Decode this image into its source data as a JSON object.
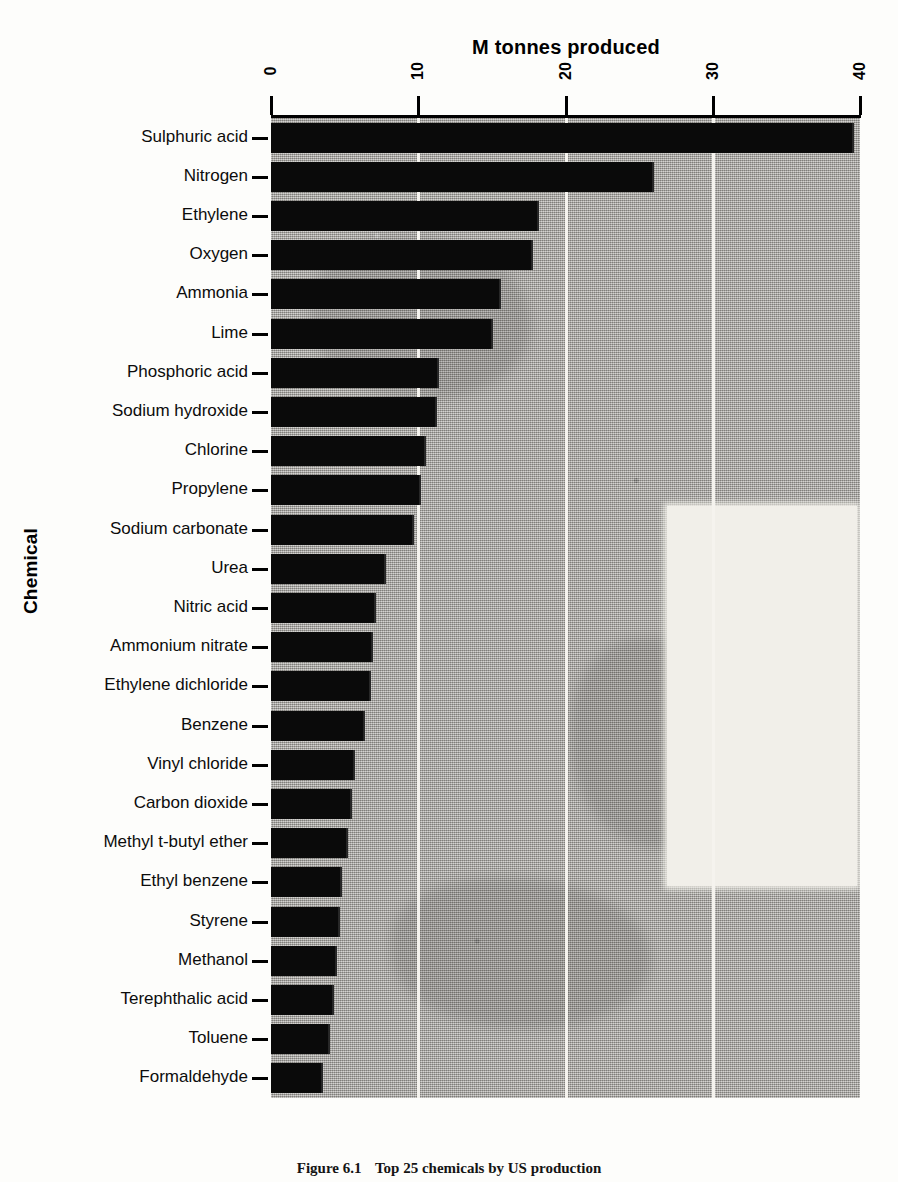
{
  "figure": {
    "caption_number": "Figure 6.1",
    "caption_text": "Top 25 chemicals by US production"
  },
  "chart_data": {
    "type": "bar",
    "orientation": "horizontal",
    "title": "M tonnes produced",
    "xlabel": "M tonnes produced",
    "ylabel": "Chemical",
    "xlim": [
      0,
      40
    ],
    "xticks": [
      "0",
      "10",
      "20",
      "30",
      "40"
    ],
    "grid": "vertical",
    "legend": "none",
    "categories": [
      "Sulphuric acid",
      "Nitrogen",
      "Ethylene",
      "Oxygen",
      "Ammonia",
      "Lime",
      "Phosphoric acid",
      "Sodium hydroxide",
      "Chlorine",
      "Propylene",
      "Sodium carbonate",
      "Urea",
      "Nitric acid",
      "Ammonium nitrate",
      "Ethylene dichloride",
      "Benzene",
      "Vinyl chloride",
      "Carbon dioxide",
      "Methyl t-butyl ether",
      "Ethyl benzene",
      "Styrene",
      "Methanol",
      "Terephthalic acid",
      "Toluene",
      "Formaldehyde"
    ],
    "values": [
      39.6,
      26.0,
      18.2,
      17.8,
      15.6,
      15.1,
      11.4,
      11.3,
      10.5,
      10.2,
      9.7,
      7.8,
      7.1,
      6.9,
      6.8,
      6.4,
      5.7,
      5.5,
      5.2,
      4.8,
      4.7,
      4.5,
      4.3,
      4.0,
      3.5
    ],
    "units": "million tonnes"
  },
  "colors": {
    "bar": "#0a0a0a",
    "plot_background": "#b5b3ae",
    "gridline": "#f5f3ee",
    "axis": "#000000",
    "page": "#fdfdfb"
  }
}
